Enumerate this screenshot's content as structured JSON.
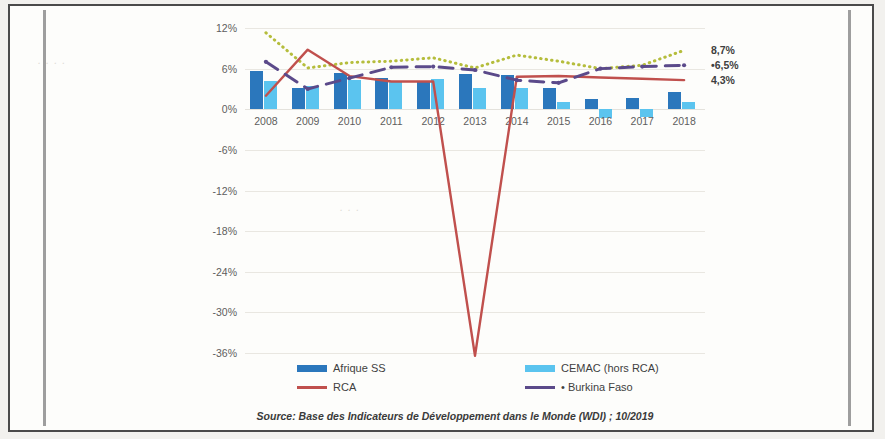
{
  "chart_data": {
    "type": "bar",
    "title": "",
    "xlabel": "",
    "ylabel": "",
    "ylim": [
      -36,
      12
    ],
    "grid": true,
    "legend_position": "bottom",
    "categories": [
      "2008",
      "2009",
      "2010",
      "2011",
      "2012",
      "2013",
      "2014",
      "2015",
      "2016",
      "2017",
      "2018"
    ],
    "ytick_labels": [
      "12%",
      "6%",
      "0%",
      "-6%",
      "-12%",
      "-18%",
      "-24%",
      "-30%",
      "-36%"
    ],
    "ytick_values": [
      12,
      6,
      0,
      -6,
      -12,
      -18,
      -24,
      -30,
      -36
    ],
    "series": [
      {
        "name": "Afrique SS",
        "type": "bar",
        "color": "#2b77bc",
        "values": [
          5.6,
          3.1,
          5.3,
          4.6,
          4.2,
          5.2,
          5.0,
          3.1,
          1.5,
          1.7,
          2.6
        ]
      },
      {
        "name": "CEMAC (hors RCA)",
        "type": "bar",
        "color": "#5bc4ef",
        "values": [
          4.1,
          3.5,
          4.3,
          4.2,
          4.4,
          3.2,
          3.1,
          1.0,
          -1.3,
          -1.2,
          1.1
        ]
      },
      {
        "name": "RCA",
        "type": "line",
        "color": "#c0504d",
        "values": [
          2.0,
          8.8,
          4.9,
          4.1,
          4.1,
          -36.4,
          4.8,
          4.9,
          4.7,
          4.5,
          4.3
        ]
      },
      {
        "name": "Burkina Faso",
        "type": "line",
        "color": "#5b4a8a",
        "style": "dashed-with-markers",
        "values": [
          7.0,
          3.0,
          4.6,
          6.2,
          6.3,
          5.8,
          4.3,
          3.9,
          6.0,
          6.3,
          6.5
        ]
      },
      {
        "name": "Tendance",
        "type": "line",
        "color": "#b5bd3c",
        "style": "dotted",
        "values": [
          11.3,
          6.1,
          6.9,
          7.1,
          7.6,
          6.1,
          8.0,
          7.1,
          6.0,
          6.5,
          8.7
        ]
      }
    ],
    "end_labels": [
      {
        "text": "8,7%",
        "value": 8.7,
        "series": "Tendance"
      },
      {
        "text": "•6,5%",
        "value": 6.5,
        "series": "Burkina Faso"
      },
      {
        "text": "4,3%",
        "value": 4.3,
        "series": "RCA"
      }
    ]
  },
  "legend": {
    "items": [
      {
        "label": "Afrique SS",
        "marker": "bar",
        "color": "#2b77bc"
      },
      {
        "label": "CEMAC (hors RCA)",
        "marker": "bar",
        "color": "#5bc4ef"
      },
      {
        "label": "RCA",
        "marker": "line",
        "color": "#c0504d"
      },
      {
        "label": "• Burkina Faso",
        "marker": "line",
        "color": "#5b4a8a"
      }
    ]
  },
  "source": {
    "text": "Source: Base des Indicateurs de Développement dans le Monde (WDI) ; 10/2019"
  }
}
